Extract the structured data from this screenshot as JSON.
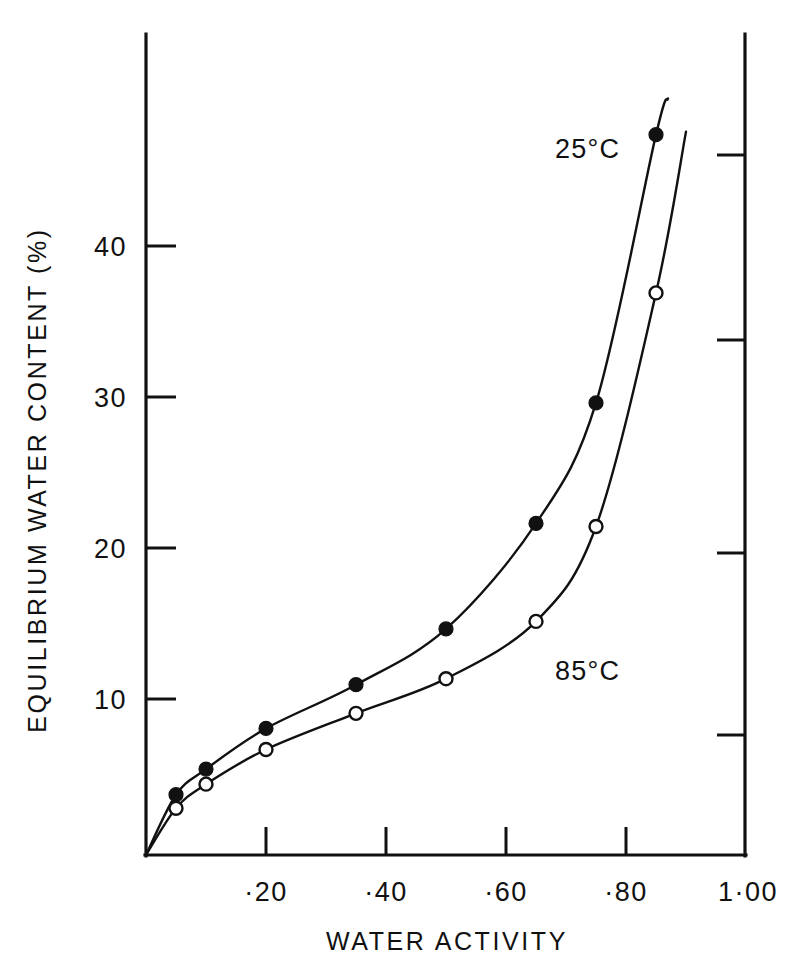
{
  "chart_data": {
    "type": "line",
    "title": "",
    "xlabel": "WATER ACTIVITY",
    "ylabel": "EQUILIBRIUM WATER CONTENT (%)",
    "xlim": [
      0,
      1.0
    ],
    "ylim": [
      0,
      50
    ],
    "grid": false,
    "legend_position": "inline-annotation",
    "xticks": [
      0.2,
      0.4,
      0.6,
      0.8,
      1.0
    ],
    "xtick_labels": [
      "·20",
      "·40",
      "·60",
      "·80",
      "1·00"
    ],
    "yticks": [
      10,
      20,
      30,
      40
    ],
    "ytick_labels": [
      "10",
      "20",
      "30",
      "40"
    ],
    "series": [
      {
        "name": "25°C",
        "marker": "filled-circle",
        "label_x": 0.62,
        "label_y": 45.5,
        "x": [
          0.0,
          0.05,
          0.1,
          0.2,
          0.35,
          0.5,
          0.65,
          0.75,
          0.85,
          0.87
        ],
        "values": [
          0.0,
          4.0,
          5.7,
          8.4,
          11.3,
          15.0,
          22.0,
          30.0,
          47.8,
          50.2
        ]
      },
      {
        "name": "85°C",
        "marker": "open-circle",
        "label_x": 0.64,
        "label_y": 13.6,
        "x": [
          0.0,
          0.05,
          0.1,
          0.2,
          0.35,
          0.5,
          0.65,
          0.75,
          0.85,
          0.9
        ],
        "values": [
          0.0,
          3.1,
          4.7,
          7.0,
          9.4,
          11.7,
          15.5,
          21.8,
          37.3,
          48.0
        ]
      }
    ],
    "marked_points": {
      "series_25C": [
        {
          "x": 0.05,
          "y": 4.0
        },
        {
          "x": 0.1,
          "y": 5.7
        },
        {
          "x": 0.2,
          "y": 8.4
        },
        {
          "x": 0.35,
          "y": 11.3
        },
        {
          "x": 0.5,
          "y": 15.0
        },
        {
          "x": 0.65,
          "y": 22.0
        },
        {
          "x": 0.75,
          "y": 30.0
        },
        {
          "x": 0.85,
          "y": 47.8
        }
      ],
      "series_85C": [
        {
          "x": 0.05,
          "y": 3.1
        },
        {
          "x": 0.1,
          "y": 4.7
        },
        {
          "x": 0.2,
          "y": 7.0
        },
        {
          "x": 0.35,
          "y": 9.4
        },
        {
          "x": 0.5,
          "y": 11.7
        },
        {
          "x": 0.65,
          "y": 15.5
        },
        {
          "x": 0.75,
          "y": 21.8
        },
        {
          "x": 0.85,
          "y": 37.3
        }
      ]
    },
    "colors": {
      "ink": "#111111",
      "background": "#ffffff"
    }
  }
}
